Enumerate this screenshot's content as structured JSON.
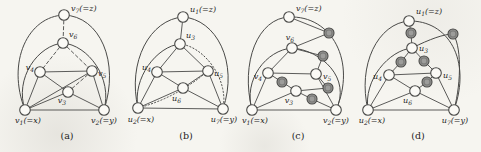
{
  "palette": {
    "background": "#f6f5f0",
    "ink": "#4a4a48",
    "node_fill": "#fbfaf6",
    "shaded_fill": "#9d9d9b",
    "label_color": "#1d1d1d"
  },
  "subfigures": [
    {
      "caption": "(a)",
      "caption_pos": [
        67,
        139
      ],
      "nodes": [
        {
          "id": "v1",
          "x": 25,
          "y": 110,
          "shaded": false,
          "label": {
            "base": "v",
            "sub": "1",
            "rest": "(=x)"
          },
          "label_pos": [
            28,
            123
          ],
          "anchor": "middle"
        },
        {
          "id": "v2",
          "x": 104,
          "y": 110,
          "shaded": false,
          "label": {
            "base": "v",
            "sub": "2",
            "rest": "(=y)"
          },
          "label_pos": [
            104,
            123
          ],
          "anchor": "middle"
        },
        {
          "id": "v3",
          "x": 68,
          "y": 92,
          "shaded": false,
          "label": {
            "base": "v",
            "sub": "3",
            "rest": ""
          },
          "label_pos": [
            66,
            103
          ],
          "anchor": "end"
        },
        {
          "id": "v4",
          "x": 40,
          "y": 72,
          "shaded": false,
          "label": {
            "base": "v",
            "sub": "4",
            "rest": ""
          },
          "label_pos": [
            34,
            70
          ],
          "anchor": "end"
        },
        {
          "id": "v5",
          "x": 92,
          "y": 71,
          "shaded": false,
          "label": {
            "base": "v",
            "sub": "5",
            "rest": ""
          },
          "label_pos": [
            98,
            76
          ],
          "anchor": "start"
        },
        {
          "id": "v6",
          "x": 63,
          "y": 43,
          "shaded": false,
          "label": {
            "base": "v",
            "sub": "6",
            "rest": ""
          },
          "label_pos": [
            69,
            37
          ],
          "anchor": "start"
        },
        {
          "id": "v7",
          "x": 64,
          "y": 15,
          "shaded": false,
          "label": {
            "base": "v",
            "sub": "7",
            "rest": "(=z)"
          },
          "label_pos": [
            71,
            11
          ],
          "anchor": "start"
        }
      ],
      "edges": [
        {
          "a": "v7",
          "b": "v1",
          "style": "solid",
          "c": [
            28,
            16,
            6,
            62
          ]
        },
        {
          "a": "v7",
          "b": "v2",
          "style": "solid",
          "c": [
            100,
            16,
            120,
            62
          ]
        },
        {
          "a": "v6",
          "b": "v1",
          "style": "solid",
          "c": [
            38,
            45,
            14,
            78
          ]
        },
        {
          "a": "v6",
          "b": "v2",
          "style": "solid",
          "c": [
            88,
            45,
            113,
            78
          ]
        },
        {
          "a": "v1",
          "b": "v2",
          "style": "solid"
        },
        {
          "a": "v1",
          "b": "v3",
          "style": "solid"
        },
        {
          "a": "v1",
          "b": "v4",
          "style": "solid"
        },
        {
          "a": "v1",
          "b": "v5",
          "style": "solid"
        },
        {
          "a": "v2",
          "b": "v3",
          "style": "solid"
        },
        {
          "a": "v2",
          "b": "v5",
          "style": "solid"
        },
        {
          "a": "v3",
          "b": "v4",
          "style": "solid"
        },
        {
          "a": "v4",
          "b": "v5",
          "style": "solid"
        },
        {
          "a": "v7",
          "b": "v6",
          "style": "dashed"
        },
        {
          "a": "v6",
          "b": "v4",
          "style": "dashed"
        },
        {
          "a": "v6",
          "b": "v5",
          "style": "dashed"
        },
        {
          "a": "v5",
          "b": "v3",
          "style": "dashed"
        }
      ]
    },
    {
      "caption": "(b)",
      "caption_pos": [
        186,
        139
      ],
      "nodes": [
        {
          "id": "u2",
          "x": 138,
          "y": 108,
          "shaded": false,
          "label": {
            "base": "u",
            "sub": "2",
            "rest": "(=x)"
          },
          "label_pos": [
            141,
            122
          ],
          "anchor": "middle"
        },
        {
          "id": "u7",
          "x": 223,
          "y": 109,
          "shaded": false,
          "label": {
            "base": "u",
            "sub": "7",
            "rest": "(=y)"
          },
          "label_pos": [
            224,
            122
          ],
          "anchor": "middle"
        },
        {
          "id": "u6",
          "x": 183,
          "y": 88,
          "shaded": false,
          "label": {
            "base": "u",
            "sub": "6",
            "rest": ""
          },
          "label_pos": [
            181,
            101
          ],
          "anchor": "end"
        },
        {
          "id": "u4",
          "x": 157,
          "y": 72,
          "shaded": false,
          "label": {
            "base": "u",
            "sub": "4",
            "rest": ""
          },
          "label_pos": [
            151,
            70
          ],
          "anchor": "end"
        },
        {
          "id": "u5",
          "x": 208,
          "y": 71,
          "shaded": false,
          "label": {
            "base": "u",
            "sub": "5",
            "rest": ""
          },
          "label_pos": [
            214,
            76
          ],
          "anchor": "start"
        },
        {
          "id": "u3",
          "x": 180,
          "y": 44,
          "shaded": false,
          "label": {
            "base": "u",
            "sub": "3",
            "rest": ""
          },
          "label_pos": [
            186,
            38
          ],
          "anchor": "start"
        },
        {
          "id": "u1",
          "x": 183,
          "y": 17,
          "shaded": false,
          "label": {
            "base": "u",
            "sub": "1",
            "rest": "(=z)"
          },
          "label_pos": [
            190,
            12
          ],
          "anchor": "start"
        }
      ],
      "edges": [
        {
          "a": "u1",
          "b": "u2",
          "style": "solid",
          "c": [
            150,
            19,
            127,
            62
          ]
        },
        {
          "a": "u1",
          "b": "u7",
          "style": "solid",
          "c": [
            216,
            19,
            239,
            62
          ]
        },
        {
          "a": "u3",
          "b": "u2",
          "style": "solid",
          "c": [
            157,
            46,
            132,
            78
          ]
        },
        {
          "a": "u3",
          "b": "u7",
          "style": "dotted",
          "c": [
            203,
            46,
            229,
            78
          ]
        },
        {
          "a": "u5",
          "b": "u2",
          "style": "dotted",
          "q": [
            176,
            98
          ]
        },
        {
          "a": "u1",
          "b": "u3",
          "style": "solid"
        },
        {
          "a": "u3",
          "b": "u4",
          "style": "solid"
        },
        {
          "a": "u3",
          "b": "u5",
          "style": "solid"
        },
        {
          "a": "u4",
          "b": "u5",
          "style": "solid"
        },
        {
          "a": "u4",
          "b": "u6",
          "style": "solid"
        },
        {
          "a": "u5",
          "b": "u6",
          "style": "solid"
        },
        {
          "a": "u4",
          "b": "u2",
          "style": "solid"
        },
        {
          "a": "u5",
          "b": "u7",
          "style": "solid"
        },
        {
          "a": "u6",
          "b": "u2",
          "style": "solid"
        },
        {
          "a": "u6",
          "b": "u7",
          "style": "solid"
        },
        {
          "a": "u2",
          "b": "u7",
          "style": "solid"
        }
      ]
    },
    {
      "caption": "(c)",
      "caption_pos": [
        298,
        139
      ],
      "nodes": [
        {
          "id": "v1",
          "x": 252,
          "y": 110,
          "shaded": false,
          "label": {
            "base": "v",
            "sub": "1",
            "rest": "(=x)"
          },
          "label_pos": [
            255,
            123
          ],
          "anchor": "middle"
        },
        {
          "id": "v2",
          "x": 336,
          "y": 110,
          "shaded": false,
          "label": {
            "base": "v",
            "sub": "2",
            "rest": "(=y)"
          },
          "label_pos": [
            336,
            123
          ],
          "anchor": "middle"
        },
        {
          "id": "v3",
          "x": 296,
          "y": 91,
          "shaded": false,
          "label": {
            "base": "v",
            "sub": "3",
            "rest": ""
          },
          "label_pos": [
            293,
            103
          ],
          "anchor": "end"
        },
        {
          "id": "v4",
          "x": 268,
          "y": 73,
          "shaded": false,
          "label": {
            "base": "v",
            "sub": "4",
            "rest": ""
          },
          "label_pos": [
            262,
            79
          ],
          "anchor": "end"
        },
        {
          "id": "v5",
          "x": 316,
          "y": 74,
          "shaded": false,
          "label": {
            "base": "v",
            "sub": "5",
            "rest": ""
          },
          "label_pos": [
            323,
            79
          ],
          "anchor": "start"
        },
        {
          "id": "v6",
          "x": 292,
          "y": 48,
          "shaded": false,
          "label": {
            "base": "v",
            "sub": "6",
            "rest": ""
          },
          "label_pos": [
            290,
            40
          ],
          "anchor": "middle"
        },
        {
          "id": "v7",
          "x": 289,
          "y": 17,
          "shaded": false,
          "label": {
            "base": "v",
            "sub": "7",
            "rest": "(=z)"
          },
          "label_pos": [
            296,
            11
          ],
          "anchor": "start"
        },
        {
          "id": "s1",
          "x": 329,
          "y": 33,
          "shaded": true
        },
        {
          "id": "s2",
          "x": 323,
          "y": 56,
          "shaded": true
        },
        {
          "id": "s3",
          "x": 282,
          "y": 82,
          "shaded": true
        },
        {
          "id": "s4",
          "x": 328,
          "y": 88,
          "shaded": true
        },
        {
          "id": "s5",
          "x": 312,
          "y": 99,
          "shaded": true
        }
      ],
      "edges": [
        {
          "a": "v7",
          "b": "v1",
          "style": "solid",
          "c": [
            258,
            18,
            240,
            62
          ]
        },
        {
          "a": "v7",
          "b": "v2",
          "style": "solid",
          "c": [
            332,
            15,
            357,
            62
          ]
        },
        {
          "a": "v6",
          "b": "v1",
          "style": "solid",
          "c": [
            266,
            50,
            243,
            80
          ]
        },
        {
          "a": "v6",
          "b": "v2",
          "style": "solid",
          "c": [
            321,
            50,
            352,
            78
          ]
        },
        {
          "a": "v7",
          "b": "s1",
          "style": "solid"
        },
        {
          "a": "s1",
          "b": "v6",
          "style": "solid"
        },
        {
          "a": "v6",
          "b": "s2",
          "style": "solid"
        },
        {
          "a": "s2",
          "b": "v5",
          "style": "solid"
        },
        {
          "a": "v6",
          "b": "v4",
          "style": "solid"
        },
        {
          "a": "v4",
          "b": "v5",
          "style": "solid"
        },
        {
          "a": "v4",
          "b": "s3",
          "style": "solid"
        },
        {
          "a": "s3",
          "b": "v3",
          "style": "solid"
        },
        {
          "a": "v5",
          "b": "s4",
          "style": "solid"
        },
        {
          "a": "s4",
          "b": "v3",
          "style": "solid"
        },
        {
          "a": "v3",
          "b": "s5",
          "style": "solid"
        },
        {
          "a": "s5",
          "b": "v2",
          "style": "solid"
        },
        {
          "a": "v5",
          "b": "v2",
          "style": "solid"
        },
        {
          "a": "v4",
          "b": "v1",
          "style": "solid"
        },
        {
          "a": "v1",
          "b": "v3",
          "style": "solid"
        },
        {
          "a": "v1",
          "b": "v2",
          "style": "solid"
        }
      ]
    },
    {
      "caption": "(d)",
      "caption_pos": [
        418,
        139
      ],
      "nodes": [
        {
          "id": "u2",
          "x": 368,
          "y": 110,
          "shaded": false,
          "label": {
            "base": "u",
            "sub": "2",
            "rest": "(=x)"
          },
          "label_pos": [
            372,
            123
          ],
          "anchor": "middle"
        },
        {
          "id": "u7",
          "x": 454,
          "y": 110,
          "shaded": false,
          "label": {
            "base": "u",
            "sub": "7",
            "rest": "(=y)"
          },
          "label_pos": [
            455,
            123
          ],
          "anchor": "middle"
        },
        {
          "id": "u6",
          "x": 415,
          "y": 91,
          "shaded": false,
          "label": {
            "base": "u",
            "sub": "6",
            "rest": ""
          },
          "label_pos": [
            412,
            103
          ],
          "anchor": "end"
        },
        {
          "id": "u4",
          "x": 389,
          "y": 75,
          "shaded": false,
          "label": {
            "base": "u",
            "sub": "4",
            "rest": ""
          },
          "label_pos": [
            382,
            79
          ],
          "anchor": "end"
        },
        {
          "id": "u5",
          "x": 436,
          "y": 73,
          "shaded": false,
          "label": {
            "base": "u",
            "sub": "5",
            "rest": ""
          },
          "label_pos": [
            443,
            78
          ],
          "anchor": "start"
        },
        {
          "id": "u3",
          "x": 412,
          "y": 48,
          "shaded": false,
          "label": {
            "base": "u",
            "sub": "3",
            "rest": ""
          },
          "label_pos": [
            419,
            51
          ],
          "anchor": "start"
        },
        {
          "id": "u1",
          "x": 409,
          "y": 21,
          "shaded": false,
          "label": {
            "base": "u",
            "sub": "1",
            "rest": "(=z)"
          },
          "label_pos": [
            416,
            14
          ],
          "anchor": "start"
        },
        {
          "id": "s1",
          "x": 411,
          "y": 33,
          "shaded": true
        },
        {
          "id": "s2",
          "x": 453,
          "y": 34,
          "shaded": true
        },
        {
          "id": "s3",
          "x": 401,
          "y": 62,
          "shaded": true
        },
        {
          "id": "s4",
          "x": 424,
          "y": 61,
          "shaded": true
        },
        {
          "id": "s5",
          "x": 427,
          "y": 82,
          "shaded": true
        }
      ],
      "edges": [
        {
          "a": "u1",
          "b": "u2",
          "style": "solid",
          "c": [
            378,
            23,
            357,
            65
          ]
        },
        {
          "a": "u1",
          "b": "u7",
          "style": "solid",
          "c": [
            448,
            20,
            472,
            60
          ]
        },
        {
          "a": "u3",
          "b": "u2",
          "style": "solid",
          "c": [
            389,
            50,
            363,
            80
          ]
        },
        {
          "a": "u3",
          "b": "s2",
          "style": "solid",
          "c": [
            430,
            39,
            444,
            34
          ]
        },
        {
          "a": "s2",
          "b": "u7",
          "style": "solid",
          "c": [
            461,
            44,
            462,
            80
          ]
        },
        {
          "a": "u1",
          "b": "s1",
          "style": "solid"
        },
        {
          "a": "s1",
          "b": "u3",
          "style": "solid"
        },
        {
          "a": "u3",
          "b": "s3",
          "style": "solid"
        },
        {
          "a": "s3",
          "b": "u4",
          "style": "solid"
        },
        {
          "a": "u3",
          "b": "s4",
          "style": "solid"
        },
        {
          "a": "s4",
          "b": "u5",
          "style": "solid"
        },
        {
          "a": "u4",
          "b": "u5",
          "style": "solid"
        },
        {
          "a": "u4",
          "b": "u6",
          "style": "solid"
        },
        {
          "a": "u4",
          "b": "u2",
          "style": "solid"
        },
        {
          "a": "u5",
          "b": "s5",
          "style": "solid"
        },
        {
          "a": "s5",
          "b": "u6",
          "style": "solid"
        },
        {
          "a": "u5",
          "b": "u7",
          "style": "solid"
        },
        {
          "a": "u6",
          "b": "u2",
          "style": "solid"
        },
        {
          "a": "u6",
          "b": "u7",
          "style": "solid"
        },
        {
          "a": "u2",
          "b": "u7",
          "style": "solid"
        }
      ]
    }
  ]
}
